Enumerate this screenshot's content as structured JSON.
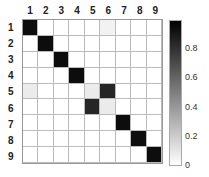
{
  "chart_data": {
    "type": "heatmap",
    "title": "",
    "xlabel": "",
    "ylabel": "",
    "x_labels": [
      "1",
      "2",
      "3",
      "4",
      "5",
      "6",
      "7",
      "8",
      "9"
    ],
    "y_labels": [
      "1",
      "2",
      "3",
      "4",
      "5",
      "6",
      "7",
      "8",
      "9"
    ],
    "values": [
      [
        0.95,
        0,
        0,
        0,
        0,
        0.05,
        0,
        0,
        0
      ],
      [
        0,
        0.95,
        0,
        0,
        0,
        0,
        0,
        0,
        0
      ],
      [
        0,
        0,
        0.95,
        0,
        0,
        0,
        0,
        0,
        0
      ],
      [
        0,
        0,
        0,
        0.95,
        0,
        0,
        0,
        0,
        0
      ],
      [
        0.08,
        0,
        0,
        0,
        0.08,
        0.85,
        0,
        0,
        0
      ],
      [
        0,
        0,
        0,
        0,
        0.85,
        0.08,
        0,
        0,
        0
      ],
      [
        0,
        0,
        0,
        0,
        0,
        0,
        0.95,
        0,
        0
      ],
      [
        0,
        0,
        0,
        0,
        0,
        0,
        0,
        0.95,
        0
      ],
      [
        0,
        0,
        0,
        0,
        0,
        0,
        0,
        0,
        0.95
      ]
    ],
    "colorbar": {
      "min": 0,
      "max": 1,
      "ticks": [
        "0",
        "0.2",
        "0.4",
        "0.6",
        "0.8"
      ],
      "colormap": "gray_r"
    }
  }
}
